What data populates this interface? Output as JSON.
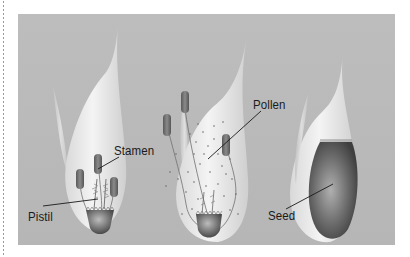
{
  "diagram": {
    "stages": [
      {
        "id": "flower",
        "labels": [
          "Stamen",
          "Pistil"
        ]
      },
      {
        "id": "pollination",
        "labels": [
          "Pollen"
        ]
      },
      {
        "id": "seed",
        "labels": [
          "Seed"
        ]
      }
    ],
    "labels": {
      "stamen": "Stamen",
      "pistil": "Pistil",
      "pollen": "Pollen",
      "seed": "Seed"
    },
    "colors": {
      "background": "#b8b8b8",
      "glume_highlight": "#f2f2f2",
      "anther": "#6f6f6f",
      "seed": "#5a5a5a",
      "leader_line": "#1a1a1a"
    }
  }
}
